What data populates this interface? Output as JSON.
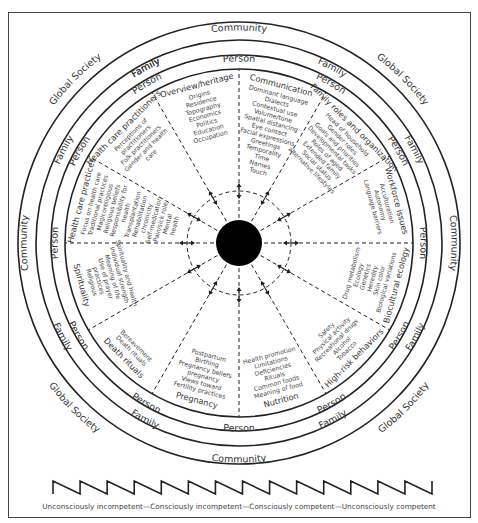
{
  "rings": {
    "outer_label": "Global Society",
    "community_label": "Community",
    "family_label": "Family",
    "person_label": "Person"
  },
  "domains": [
    {
      "title": "Overview/heritage",
      "items": [
        "Origins",
        "Residence",
        "Topography",
        "Economics",
        "Politics",
        "Education",
        "Occupation"
      ]
    },
    {
      "title": "Communication",
      "items": [
        "Dominant language",
        "Dialects",
        "Contextual use",
        "Volume/tone",
        "Spatial distancing",
        "Eye contact",
        "Facial expressions",
        "Greetings",
        "Temporality",
        "Time",
        "Names",
        "Touch"
      ]
    },
    {
      "title": "Family roles and organization",
      "items": [
        "Head of household",
        "Gender roles",
        "Goals and priorities",
        "Developmental tasks",
        "Roles of aged",
        "Extended family",
        "Social status",
        "alternative lifestyles"
      ]
    },
    {
      "title": "Workforce issues",
      "items": [
        "Acculturation",
        "Autonomy",
        "Language barriers"
      ]
    },
    {
      "title": "Biocultural ecology",
      "items": [
        "Biological variations",
        "Skin color",
        "Heredity",
        "Genetics",
        "Ecology",
        "Drug metabolism"
      ]
    },
    {
      "title": "High-risk behaviors",
      "items": [
        "Tobacco",
        "Alcohol",
        "Recreational drugs",
        "Physical activity",
        "Safety"
      ]
    },
    {
      "title": "Nutrition",
      "items": [
        "Meaning of food",
        "Common foods",
        "Rituals",
        "Deficiencies",
        "Limitations",
        "Health promotion"
      ]
    },
    {
      "title": "Pregnancy",
      "items": [
        "Fertility practices",
        "Views toward",
        "pregnancy",
        "Pregnancy beliefs",
        "Birthing",
        "Postpartum"
      ]
    },
    {
      "title": "Death rituals",
      "items": [
        "Death rituals",
        "Bereavement"
      ]
    },
    {
      "title": "Spirituality",
      "items": [
        "Religious",
        "practices",
        "Use of prayer",
        "Meaning of life",
        "Individual strength",
        "Spirituality and health"
      ]
    },
    {
      "title": "Health care practices",
      "items": [
        "Focus on health care",
        "Traditional practices",
        "Magicoreligious",
        "Religious beliefs",
        "Responsibility for",
        "health",
        "Transplantation",
        "Rehabilitation",
        "chronicity",
        "Self-medication",
        "Pain/sick role",
        "Mental",
        "health",
        "Barriers"
      ]
    },
    {
      "title": "Health care practitioners",
      "items": [
        "Perceptions of",
        "practitioners",
        "Folk practitioners",
        "Gender and health",
        "care"
      ]
    }
  ],
  "caption": "Unconsciously incompetent—Consciously incompetent—Consciously competent—Unconsciously competent",
  "colors": {
    "ink": "#222222",
    "text": "#333333",
    "center": "#000000"
  }
}
